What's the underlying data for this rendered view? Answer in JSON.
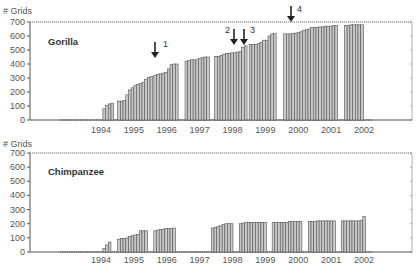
{
  "chart_data": [
    {
      "type": "bar",
      "title": "Gorilla",
      "ylabel": "# Grids",
      "xlabel": "",
      "ylim": [
        0,
        700
      ],
      "yticks": [
        0,
        100,
        200,
        300,
        400,
        500,
        600,
        700
      ],
      "xticks": [
        "1994",
        "1995",
        "1996",
        "1997",
        "1998",
        "1999",
        "2000",
        "2001",
        "2002"
      ],
      "grid": false,
      "reference_line": 700,
      "annotations": [
        {
          "label": "1",
          "position": "1996 (mid)",
          "type": "down-arrow"
        },
        {
          "label": "2",
          "position": "1998 (late)",
          "type": "down-arrow"
        },
        {
          "label": "3",
          "position": "1998 (end)",
          "type": "down-arrow"
        },
        {
          "label": "4",
          "position": "2000 (early)",
          "type": "down-arrow"
        }
      ],
      "series": [
        {
          "name": "Gorilla",
          "groups": [
            {
              "start": 1994.3,
              "values": [
                80,
                105,
                115,
                120
              ]
            },
            {
              "start": 1994.75,
              "values": [
                135,
                135,
                140,
                180,
                215,
                230,
                245,
                255,
                260,
                270,
                290,
                305,
                310
              ]
            },
            {
              "start": 1995.85,
              "values": [
                320,
                325,
                330,
                335,
                340,
                365,
                395,
                400,
                400
              ]
            },
            {
              "start": 1996.8,
              "values": [
                420,
                425,
                430,
                430,
                430,
                440,
                445,
                450,
                450
              ]
            },
            {
              "start": 1997.7,
              "values": [
                455,
                455,
                460,
                470,
                475,
                475,
                480,
                480,
                485,
                490,
                520,
                530
              ]
            },
            {
              "start": 1998.75,
              "values": [
                540,
                540,
                540,
                545,
                555,
                570,
                570,
                600,
                615,
                620
              ]
            },
            {
              "start": 1999.8,
              "values": [
                615,
                615,
                615,
                620,
                620,
                625,
                630,
                640,
                645,
                650,
                660
              ]
            },
            {
              "start": 2000.7,
              "values": [
                660,
                660,
                665,
                665,
                670,
                670,
                670,
                675,
                675
              ]
            },
            {
              "start": 2001.65,
              "values": [
                675,
                675,
                680,
                680,
                680,
                680,
                680
              ]
            }
          ]
        }
      ]
    },
    {
      "type": "bar",
      "title": "Chimpanzee",
      "ylabel": "# Grids",
      "xlabel": "",
      "ylim": [
        0,
        700
      ],
      "yticks": [
        0,
        100,
        200,
        300,
        400,
        500,
        600,
        700
      ],
      "xticks": [
        "1994",
        "1995",
        "1996",
        "1997",
        "1998",
        "1999",
        "2000",
        "2001",
        "2002"
      ],
      "grid": false,
      "reference_line": 700,
      "series": [
        {
          "name": "Chimpanzee",
          "groups": [
            {
              "start": 1994.3,
              "values": [
                25,
                50,
                70
              ]
            },
            {
              "start": 1994.75,
              "values": [
                90,
                95,
                95,
                100,
                110,
                115,
                120,
                125,
                150,
                150,
                150
              ]
            },
            {
              "start": 1995.85,
              "values": [
                150,
                155,
                160,
                160,
                165,
                165,
                165,
                170
              ]
            },
            {
              "start": 1997.6,
              "values": [
                170,
                175,
                180,
                185,
                195,
                200,
                200,
                200
              ]
            },
            {
              "start": 1998.45,
              "values": [
                200,
                205,
                210,
                210,
                210,
                210,
                210,
                210,
                210,
                210
              ]
            },
            {
              "start": 1999.45,
              "values": [
                210,
                210,
                210,
                210,
                210,
                210,
                215,
                215,
                215,
                215,
                215
              ]
            },
            {
              "start": 2000.55,
              "values": [
                215,
                215,
                215,
                220,
                220,
                220,
                220,
                220,
                220,
                220
              ]
            },
            {
              "start": 2001.55,
              "values": [
                220,
                220,
                220,
                220,
                220,
                220,
                220,
                225,
                250
              ]
            }
          ]
        }
      ]
    }
  ],
  "panels": {
    "top": {
      "title": "Gorilla",
      "ylabel": "# Grids"
    },
    "bottom": {
      "title": "Chimpanzee",
      "ylabel": "# Grids"
    }
  },
  "yticks": [
    "0",
    "100",
    "200",
    "300",
    "400",
    "500",
    "600",
    "700"
  ],
  "xticks": [
    "1994",
    "1995",
    "1996",
    "1997",
    "1998",
    "1999",
    "2000",
    "2001",
    "2002"
  ],
  "arrows": [
    "1",
    "2",
    "3",
    "4"
  ],
  "colors": {
    "bar_fill": "#c8c8c8",
    "bar_stroke": "#555555",
    "axis": "#555555"
  }
}
